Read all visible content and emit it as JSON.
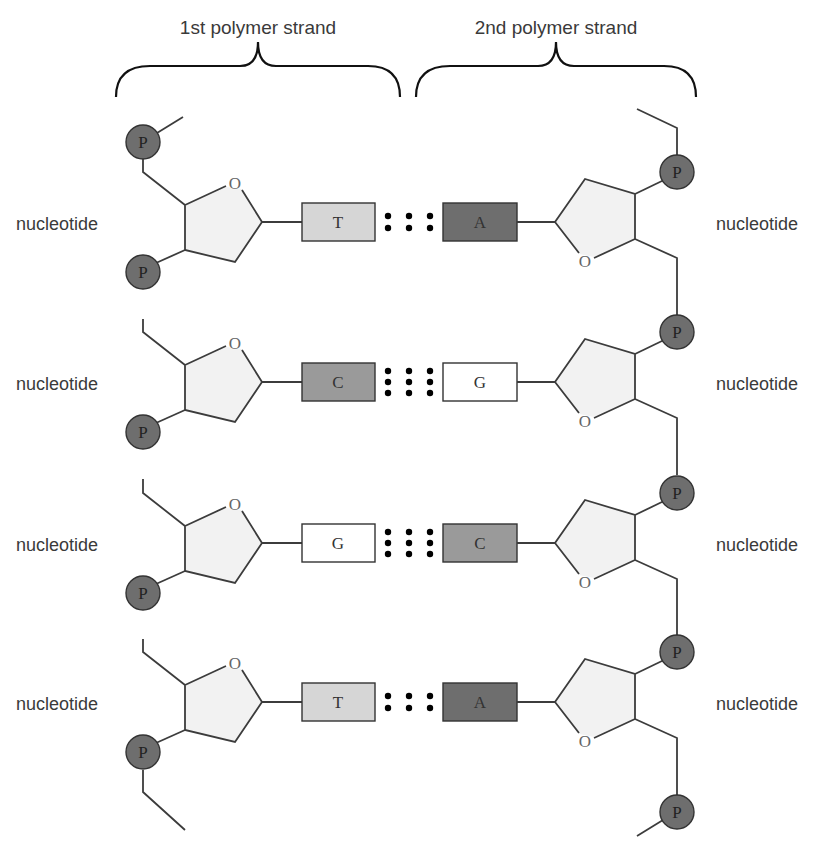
{
  "strands": {
    "first": {
      "label": "1st polymer strand"
    },
    "second": {
      "label": "2nd polymer strand"
    }
  },
  "nucleotide_label": "nucleotide",
  "sugar_oxygen_label": "O",
  "phosphate_label": "P",
  "colors": {
    "line": "#3c3c3c",
    "sugar_fill": "#f2f2f2",
    "phosphate_fill": "#6e6e6e",
    "base_T": "#d6d6d6",
    "base_A": "#6e6e6e",
    "base_C": "#9a9a9a",
    "base_G": "#ffffff",
    "hbond_dot": "#000000",
    "text": "#3a3a3a"
  },
  "pairs": [
    {
      "left": "T",
      "right": "A",
      "bonds": 2
    },
    {
      "left": "C",
      "right": "G",
      "bonds": 3
    },
    {
      "left": "G",
      "right": "C",
      "bonds": 3
    },
    {
      "left": "T",
      "right": "A",
      "bonds": 2
    }
  ]
}
